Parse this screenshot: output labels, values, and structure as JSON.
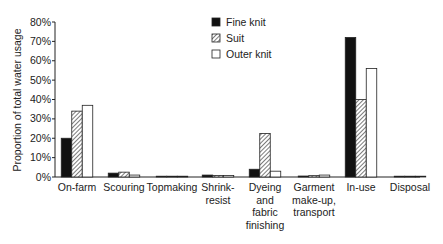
{
  "chart_data": {
    "type": "bar",
    "title": "",
    "xlabel": "",
    "ylabel": "Proportion of total water usage",
    "ylim": [
      0,
      80
    ],
    "yticks": [
      "0%",
      "10%",
      "20%",
      "30%",
      "40%",
      "50%",
      "60%",
      "70%",
      "80%"
    ],
    "grid": false,
    "legend_position": "top-center",
    "categories": [
      [
        "On-farm"
      ],
      [
        "Scouring"
      ],
      [
        "Topmaking"
      ],
      [
        "Shrink-",
        "resist"
      ],
      [
        "Dyeing",
        "and",
        "fabric",
        "finishing"
      ],
      [
        "Garment",
        "make-up,",
        "transport"
      ],
      [
        "In-use"
      ],
      [
        "Disposal"
      ]
    ],
    "series": [
      {
        "name": "Fine knit",
        "fill": "black",
        "values": [
          20,
          2,
          0.3,
          1,
          4,
          0.5,
          72,
          0.2
        ]
      },
      {
        "name": "Suit",
        "fill": "hatched",
        "values": [
          34,
          2.5,
          0.3,
          0.8,
          22.5,
          0.7,
          40,
          0.2
        ]
      },
      {
        "name": "Outer knit",
        "fill": "white",
        "values": [
          37,
          1,
          0.2,
          0.8,
          3,
          1,
          56,
          0.2
        ]
      }
    ]
  },
  "legend": {
    "items": [
      {
        "label": "Fine knit"
      },
      {
        "label": "Suit"
      },
      {
        "label": "Outer knit"
      }
    ]
  },
  "caption": "Fig. 1.1 Water usage across the garment life cycle stages"
}
